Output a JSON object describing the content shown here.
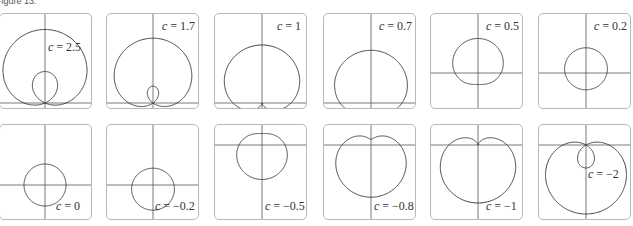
{
  "caption": "Figure 13.",
  "chart_data": {
    "type": "line",
    "title": "Figure 13.",
    "equation": "r = 1 + c*sin(theta)",
    "grid": false,
    "panels": [
      {
        "c": 2.5,
        "label": "c = 2.5",
        "ox": 45,
        "oy": 89,
        "scale": 21,
        "lx": 48,
        "ly": 26
      },
      {
        "c": 1.7,
        "label": "c = 1.7",
        "ox": 46,
        "oy": 89,
        "scale": 24,
        "lx": 55,
        "ly": 5
      },
      {
        "c": 1,
        "label": "c = 1",
        "ox": 47,
        "oy": 89,
        "scale": 29,
        "lx": 62,
        "ly": 5
      },
      {
        "c": 0.7,
        "label": "c = 0.7",
        "ox": 47,
        "oy": 89,
        "scale": 31,
        "lx": 55,
        "ly": 5
      },
      {
        "c": 0.5,
        "label": "c = 0.5",
        "ox": 47,
        "oy": 59,
        "scale": 23,
        "lx": 55,
        "ly": 5
      },
      {
        "c": 0.2,
        "label": "c = 0.2",
        "ox": 47,
        "oy": 59,
        "scale": 21,
        "lx": 55,
        "ly": 5
      },
      {
        "c": 0,
        "label": "c = 0",
        "ox": 45,
        "oy": 60,
        "scale": 21,
        "lx": 56,
        "ly": 74
      },
      {
        "c": -0.2,
        "label": "c = −0.2",
        "ox": 46,
        "oy": 60,
        "scale": 21,
        "lx": 48,
        "ly": 74
      },
      {
        "c": -0.5,
        "label": "c = −0.5",
        "ox": 47,
        "oy": 20,
        "scale": 23,
        "lx": 50,
        "ly": 74
      },
      {
        "c": -0.8,
        "label": "c = −0.8",
        "ox": 47,
        "oy": 20,
        "scale": 29,
        "lx": 50,
        "ly": 74
      },
      {
        "c": -1,
        "label": "c = −1",
        "ox": 47,
        "oy": 20,
        "scale": 29,
        "lx": 55,
        "ly": 74
      },
      {
        "c": -2,
        "label": "c = −2",
        "ox": 47,
        "oy": 20,
        "scale": 23,
        "lx": 49,
        "ly": 42
      }
    ]
  }
}
